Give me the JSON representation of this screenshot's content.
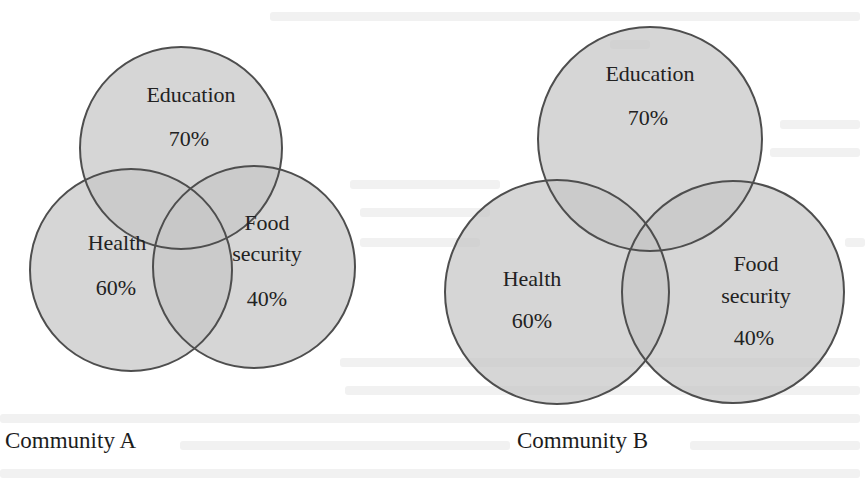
{
  "figure": {
    "type": "venn-diagram",
    "colors": {
      "fill": "#c6c6c6",
      "fill_opacity": 0.72,
      "stroke": "#4e4e4e",
      "text": "#222222",
      "background": "#ffffff"
    },
    "panels": [
      {
        "caption": "Community A",
        "sets": [
          {
            "name": "Education",
            "label": "Education",
            "value": "70%"
          },
          {
            "name": "Health",
            "label": "Health",
            "value": "60%"
          },
          {
            "name": "Food security",
            "label_line1": "Food",
            "label_line2": "security",
            "value": "40%"
          }
        ]
      },
      {
        "caption": "Community B",
        "sets": [
          {
            "name": "Education",
            "label": "Education",
            "value": "70%"
          },
          {
            "name": "Health",
            "label": "Health",
            "value": "60%"
          },
          {
            "name": "Food security",
            "label_line1": "Food",
            "label_line2": "security",
            "value": "40%"
          }
        ]
      }
    ]
  }
}
